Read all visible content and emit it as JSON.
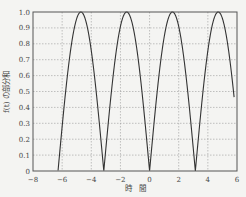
{
  "chart_data": {
    "type": "line",
    "title": "",
    "xlabel": "時　間",
    "ylabel": "f(t) の部分和",
    "xlim": [
      -8,
      6
    ],
    "ylim": [
      0,
      1.0
    ],
    "xticks": [
      -8,
      -6,
      -4,
      -2,
      0,
      2,
      4,
      6
    ],
    "xtick_labels": [
      "−8",
      "−6",
      "−4",
      "−2",
      "0",
      "2",
      "4",
      "6"
    ],
    "yticks": [
      0,
      0.1,
      0.2,
      0.3,
      0.4,
      0.5,
      0.6,
      0.7,
      0.8,
      0.9,
      1.0
    ],
    "ytick_labels": [
      "0",
      "0.1",
      "0.2",
      "0.3",
      "0.4",
      "0.5",
      "0.6",
      "0.7",
      "0.8",
      "0.9",
      "1.0"
    ],
    "grid": true,
    "legend": null,
    "series": [
      {
        "name": "|sin t|",
        "function": "abs(sin(t))",
        "t_range": [
          -6.28,
          5.8
        ],
        "x": [
          -6.28,
          -5.5,
          -4.71,
          -3.9,
          -3.14,
          -2.4,
          -1.57,
          -0.8,
          0.0,
          0.8,
          1.57,
          2.4,
          3.14,
          3.9,
          4.71,
          5.5,
          5.8
        ],
        "values": [
          0.0,
          0.71,
          1.0,
          0.69,
          0.0,
          0.68,
          1.0,
          0.72,
          0.0,
          0.72,
          1.0,
          0.68,
          0.0,
          0.69,
          1.0,
          0.71,
          0.46
        ],
        "color": "#333333"
      }
    ]
  },
  "colors": {
    "background": "#f4f4f2",
    "frame": "#555555",
    "grid": "#9a9a9a",
    "line": "#333333"
  }
}
